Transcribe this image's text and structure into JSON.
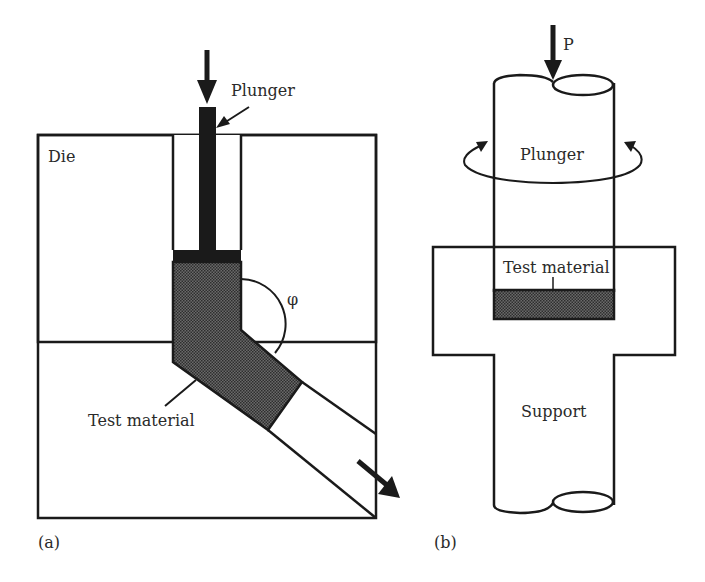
{
  "panel_a": {
    "caption": "(a)",
    "labels": {
      "die": "Die",
      "plunger": "Plunger",
      "test_material": "Test material",
      "angle": "φ"
    }
  },
  "panel_b": {
    "caption": "(b)",
    "labels": {
      "load": "P",
      "plunger": "Plunger",
      "test_material": "Test material",
      "support": "Support"
    }
  },
  "colors": {
    "stroke": "#1a1a1a",
    "hatch_fill": "#555555",
    "background": "#ffffff"
  }
}
